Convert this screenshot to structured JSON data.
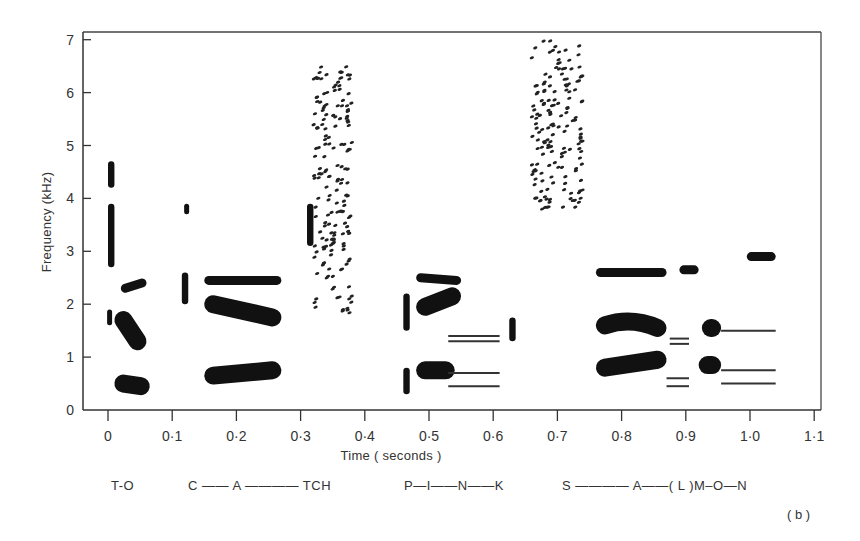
{
  "chart_data": {
    "type": "heatmap",
    "subtype": "speech spectrogram (formant blobs, schematic)",
    "panel_label": "( b )",
    "xlabel": "Time ( seconds )",
    "ylabel": "Frequency (kHz)",
    "xlim": [
      0,
      1.1
    ],
    "ylim": [
      0,
      7
    ],
    "grid": false,
    "x_ticks": [
      "0",
      "0·1",
      "0·2",
      "0·3",
      "0·4",
      "0·5",
      "0·6",
      "0·7",
      "0·8",
      "0·9",
      "1·0",
      "1·1"
    ],
    "y_ticks": [
      "0",
      "1",
      "2",
      "3",
      "4",
      "5",
      "6",
      "7"
    ],
    "phoneme_labels": [
      {
        "text": "T-O",
        "t": 0.035
      },
      {
        "text": "C —— A ———— TCH",
        "t": 0.21
      },
      {
        "text": "P—I——N——K",
        "t": 0.56
      },
      {
        "text": "S ———— A——( L )M–O—N",
        "t": 0.87
      }
    ],
    "formant_blobs": [
      {
        "segment": "T burst",
        "t0": 0.0,
        "t1": 0.01,
        "f0": 4.2,
        "f1": 4.7,
        "kind": "spike"
      },
      {
        "segment": "T burst",
        "t0": 0.0,
        "t1": 0.01,
        "f0": 2.7,
        "f1": 3.9,
        "kind": "spike"
      },
      {
        "segment": "T burst",
        "t0": 0.0,
        "t1": 0.005,
        "f0": 1.6,
        "f1": 1.9,
        "kind": "spike"
      },
      {
        "segment": "O F3",
        "t0": 0.02,
        "t1": 0.06,
        "f0": 2.3,
        "f1": 2.4,
        "kind": "formant"
      },
      {
        "segment": "O F2",
        "t0": 0.01,
        "t1": 0.06,
        "f0": 1.7,
        "f1": 1.3,
        "kind": "formant"
      },
      {
        "segment": "O F1",
        "t0": 0.01,
        "t1": 0.065,
        "f0": 0.5,
        "f1": 0.45,
        "kind": "formant"
      },
      {
        "segment": "C burst",
        "t0": 0.12,
        "t1": 0.125,
        "f0": 3.7,
        "f1": 3.9,
        "kind": "spike"
      },
      {
        "segment": "C burst",
        "t0": 0.115,
        "t1": 0.125,
        "f0": 2.0,
        "f1": 2.6,
        "kind": "spike"
      },
      {
        "segment": "A F3",
        "t0": 0.15,
        "t1": 0.27,
        "f0": 2.45,
        "f1": 2.45,
        "kind": "formant"
      },
      {
        "segment": "A F2",
        "t0": 0.15,
        "t1": 0.27,
        "f0": 2.0,
        "f1": 1.75,
        "kind": "formant"
      },
      {
        "segment": "A F1",
        "t0": 0.15,
        "t1": 0.27,
        "f0": 0.65,
        "f1": 0.75,
        "kind": "formant"
      },
      {
        "segment": "TCH burst",
        "t0": 0.31,
        "t1": 0.32,
        "f0": 3.1,
        "f1": 3.9,
        "kind": "spike"
      },
      {
        "segment": "TCH frication",
        "t0": 0.32,
        "t1": 0.38,
        "f0": 1.8,
        "f1": 6.5,
        "kind": "noise"
      },
      {
        "segment": "P burst",
        "t0": 0.46,
        "t1": 0.47,
        "f0": 1.5,
        "f1": 2.2,
        "kind": "spike"
      },
      {
        "segment": "P burst",
        "t0": 0.46,
        "t1": 0.47,
        "f0": 0.3,
        "f1": 0.8,
        "kind": "spike"
      },
      {
        "segment": "I F3",
        "t0": 0.48,
        "t1": 0.55,
        "f0": 2.5,
        "f1": 2.45,
        "kind": "formant"
      },
      {
        "segment": "I F2",
        "t0": 0.48,
        "t1": 0.55,
        "f0": 1.95,
        "f1": 2.15,
        "kind": "formant"
      },
      {
        "segment": "I F1",
        "t0": 0.48,
        "t1": 0.54,
        "f0": 0.75,
        "f1": 0.75,
        "kind": "formant"
      },
      {
        "segment": "N nasal",
        "t0": 0.53,
        "t1": 0.61,
        "f0": 1.4,
        "f1": 1.4,
        "kind": "line"
      },
      {
        "segment": "N nasal",
        "t0": 0.53,
        "t1": 0.61,
        "f0": 1.3,
        "f1": 1.3,
        "kind": "line"
      },
      {
        "segment": "N nasal",
        "t0": 0.53,
        "t1": 0.61,
        "f0": 0.7,
        "f1": 0.7,
        "kind": "line"
      },
      {
        "segment": "N nasal",
        "t0": 0.53,
        "t1": 0.61,
        "f0": 0.45,
        "f1": 0.45,
        "kind": "line"
      },
      {
        "segment": "K burst",
        "t0": 0.625,
        "t1": 0.635,
        "f0": 1.3,
        "f1": 1.75,
        "kind": "spike"
      },
      {
        "segment": "S frication",
        "t0": 0.66,
        "t1": 0.74,
        "f0": 3.7,
        "f1": 7.0,
        "kind": "noise"
      },
      {
        "segment": "A F3",
        "t0": 0.76,
        "t1": 0.87,
        "f0": 2.6,
        "f1": 2.6,
        "kind": "formant"
      },
      {
        "segment": "A F2",
        "t0": 0.76,
        "t1": 0.87,
        "f0": 1.6,
        "f1": 1.55,
        "kind": "formant"
      },
      {
        "segment": "A F1",
        "t0": 0.76,
        "t1": 0.87,
        "f0": 0.8,
        "f1": 0.95,
        "kind": "formant"
      },
      {
        "segment": "L/M F3",
        "t0": 0.89,
        "t1": 0.92,
        "f0": 2.65,
        "f1": 2.65,
        "kind": "formant"
      },
      {
        "segment": "L/M nasal",
        "t0": 0.875,
        "t1": 0.905,
        "f0": 1.35,
        "f1": 1.35,
        "kind": "line"
      },
      {
        "segment": "L/M nasal",
        "t0": 0.875,
        "t1": 0.905,
        "f0": 1.25,
        "f1": 1.25,
        "kind": "line"
      },
      {
        "segment": "L/M nasal",
        "t0": 0.87,
        "t1": 0.905,
        "f0": 0.6,
        "f1": 0.6,
        "kind": "line"
      },
      {
        "segment": "L/M nasal",
        "t0": 0.87,
        "t1": 0.905,
        "f0": 0.45,
        "f1": 0.45,
        "kind": "line"
      },
      {
        "segment": "O F2",
        "t0": 0.925,
        "t1": 0.955,
        "f0": 1.55,
        "f1": 1.55,
        "kind": "formant"
      },
      {
        "segment": "O F1",
        "t0": 0.92,
        "t1": 0.955,
        "f0": 0.85,
        "f1": 0.85,
        "kind": "formant"
      },
      {
        "segment": "N F3",
        "t0": 0.995,
        "t1": 1.04,
        "f0": 2.9,
        "f1": 2.9,
        "kind": "formant"
      },
      {
        "segment": "N nasal",
        "t0": 0.955,
        "t1": 1.04,
        "f0": 1.5,
        "f1": 1.5,
        "kind": "line"
      },
      {
        "segment": "N nasal",
        "t0": 0.955,
        "t1": 1.04,
        "f0": 0.75,
        "f1": 0.75,
        "kind": "line"
      },
      {
        "segment": "N nasal",
        "t0": 0.955,
        "t1": 1.04,
        "f0": 0.5,
        "f1": 0.5,
        "kind": "line"
      }
    ]
  },
  "labels": {
    "ylabel": "Frequency (kHz)",
    "xlabel": "Time ( seconds )",
    "panel": "( b )",
    "phrase": [
      "T-O",
      "C —— A ———— TCH",
      "P—I——N——K",
      "S ———— A——( L )M–O—N"
    ]
  }
}
